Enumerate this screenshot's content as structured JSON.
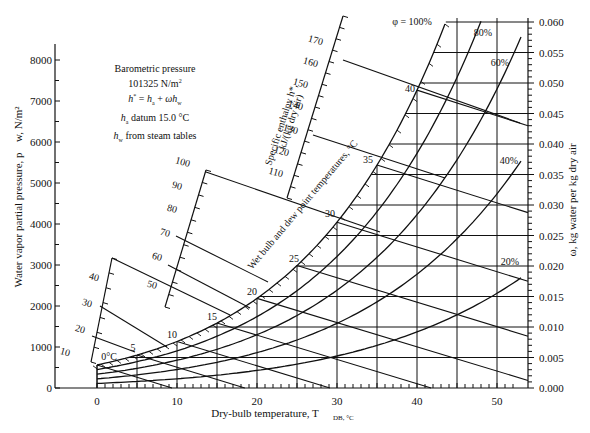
{
  "chart_data": {
    "type": "line",
    "annotation": {
      "lines": [
        "Barometric pressure",
        "101325 N/m²",
        "h* = h_a + ωh_w",
        "h_a datum 15.0 °C",
        "h_w from steam tables"
      ]
    },
    "xlabel": "Dry-bulb temperature, T_DB, °C",
    "ylabel_left": "Water vapor partial pressure, p_w, N/m²",
    "ylabel_right": "ω, kg water per kg dry air",
    "x_ticks": [
      0,
      10,
      20,
      30,
      40,
      50
    ],
    "xlim": [
      -7,
      53
    ],
    "y_left_ticks": [
      0,
      1000,
      2000,
      3000,
      4000,
      5000,
      6000,
      7000,
      8000
    ],
    "y_left_range": [
      0,
      8000
    ],
    "y_right_ticks": [
      "0.000",
      "0.005",
      "0.010",
      "0.015",
      "0.020",
      "0.025",
      "0.030",
      "0.035",
      "0.040",
      "0.045",
      "0.050",
      "0.055",
      "0.060"
    ],
    "y_right_range": [
      0,
      0.06
    ],
    "barometric_pressure_Pa": 101325,
    "relative_humidity_curves": [
      {
        "name": "φ = 100%",
        "phi": 1.0
      },
      {
        "name": "80%",
        "phi": 0.8
      },
      {
        "name": "60%",
        "phi": 0.6
      },
      {
        "name": "40%",
        "phi": 0.4
      },
      {
        "name": "20%",
        "phi": 0.2
      }
    ],
    "saturation_pressure_Pa": {
      "T": [
        0,
        5,
        10,
        15,
        20,
        25,
        30,
        35,
        40,
        45,
        50,
        55
      ],
      "p": [
        611,
        872,
        1228,
        1705,
        2339,
        3169,
        4246,
        5628,
        7384,
        9593,
        12350,
        15760
      ]
    },
    "wet_bulb_dew_point_scale": {
      "label": "Wet bulb and dew point temperatures, °C",
      "labels": [
        "0°C",
        "5",
        "10",
        "15",
        "20",
        "25",
        "30",
        "35",
        "40"
      ]
    },
    "enthalpy_scale": {
      "label": "Specific enthalpy h*, kJ/(kg dry air)",
      "lower_scale_labels": [
        "10",
        "20",
        "30",
        "40"
      ],
      "middle_scale_labels": [
        "50",
        "60",
        "70",
        "80",
        "90",
        "100"
      ],
      "upper_scale_labels": [
        "110",
        "120",
        "130",
        "140",
        "150",
        "160",
        "170"
      ]
    }
  }
}
